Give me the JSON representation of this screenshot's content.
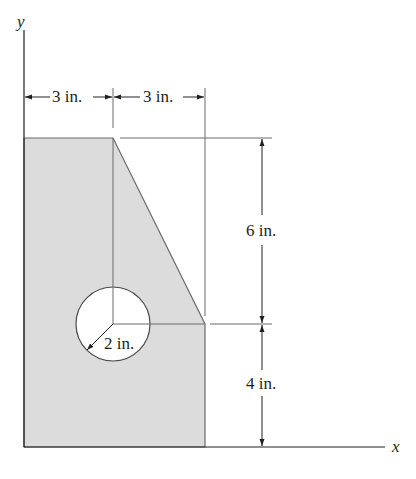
{
  "figure": {
    "axes": {
      "x_label": "x",
      "y_label": "y"
    },
    "dimensions": {
      "top_left_width": "3 in.",
      "top_right_width": "3 in.",
      "upper_height": "6 in.",
      "lower_height": "4 in.",
      "hole_radius": "2 in."
    },
    "colors": {
      "fill": "#dcdcdc",
      "line": "#4a4a4a",
      "text": "#231f20"
    }
  }
}
